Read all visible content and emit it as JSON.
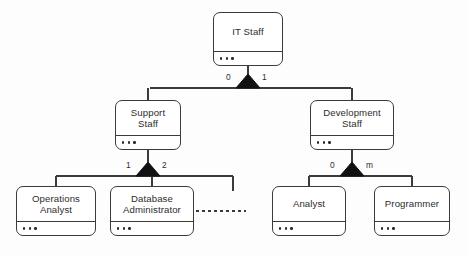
{
  "diagram": {
    "type": "uml-class-hierarchy",
    "notation": "generalization with filled triangle and cardinality labels",
    "canvas": {
      "width": 468,
      "height": 256
    },
    "colors": {
      "background": "#fdfdfd",
      "box_fill": "#ffffff",
      "stroke": "#3b3b3b",
      "text": "#2d2d2d",
      "triangle_fill": "#111111"
    },
    "members_placeholder": "...",
    "classes": [
      {
        "id": "it-staff",
        "name": "IT Staff",
        "name_lines": [
          "IT Staff"
        ],
        "members": "...",
        "x": 213,
        "y": 12,
        "w": 70,
        "h": 54,
        "level": 0
      },
      {
        "id": "support-staff",
        "name": "Support Staff",
        "name_lines": [
          "Support",
          "Staff"
        ],
        "members": "...",
        "x": 115,
        "y": 100,
        "w": 66,
        "h": 50,
        "level": 1
      },
      {
        "id": "development-staff",
        "name": "Development Staff",
        "name_lines": [
          "Development",
          "Staff"
        ],
        "members": "...",
        "x": 310,
        "y": 100,
        "w": 84,
        "h": 50,
        "level": 1
      },
      {
        "id": "operations-analyst",
        "name": "Operations Analyst",
        "name_lines": [
          "Operations",
          "Analyst"
        ],
        "members": "...",
        "x": 16,
        "y": 186,
        "w": 80,
        "h": 50,
        "level": 2
      },
      {
        "id": "database-administrator",
        "name": "Database Administrator",
        "name_lines": [
          "Database",
          "Administrator"
        ],
        "members": "...",
        "x": 110,
        "y": 186,
        "w": 84,
        "h": 50,
        "level": 2
      },
      {
        "id": "analyst",
        "name": "Analyst",
        "name_lines": [
          "Analyst"
        ],
        "members": "...",
        "x": 272,
        "y": 186,
        "w": 74,
        "h": 50,
        "level": 2
      },
      {
        "id": "programmer",
        "name": "Programmer",
        "name_lines": [
          "Programmer"
        ],
        "members": "...",
        "x": 374,
        "y": 186,
        "w": 76,
        "h": 50,
        "level": 2
      }
    ],
    "generalizations": [
      {
        "id": "gen-it-staff",
        "parent": "it-staff",
        "children": [
          "support-staff",
          "development-staff"
        ],
        "left_cardinality": "0",
        "right_cardinality": "1",
        "triangle_apex_x": 248,
        "triangle_apex_y": 74,
        "triangle_base_y": 88,
        "bar_y": 88,
        "bar_x1": 150,
        "bar_x2": 351
      },
      {
        "id": "gen-support-staff",
        "parent": "support-staff",
        "children": [
          "operations-analyst",
          "database-administrator"
        ],
        "left_cardinality": "1",
        "right_cardinality": "2",
        "triangle_apex_x": 148,
        "triangle_apex_y": 162,
        "triangle_base_y": 176,
        "bar_y": 176,
        "bar_x1": 56,
        "bar_x2": 233
      },
      {
        "id": "gen-development-staff",
        "parent": "development-staff",
        "children": [
          "analyst",
          "programmer"
        ],
        "left_cardinality": "0",
        "right_cardinality": "m",
        "triangle_apex_x": 352,
        "triangle_apex_y": 162,
        "triangle_base_y": 176,
        "bar_y": 176,
        "bar_x1": 309,
        "bar_x2": 412
      }
    ],
    "extra_edges": [
      {
        "id": "dashed-association",
        "style": "dashed",
        "from": "database-administrator",
        "x1": 196,
        "y1": 211,
        "x2": 246,
        "y2": 211
      },
      {
        "id": "support-bar-right-drop",
        "style": "solid",
        "x1": 233,
        "y1": 176,
        "x2": 233,
        "y2": 191
      }
    ]
  }
}
